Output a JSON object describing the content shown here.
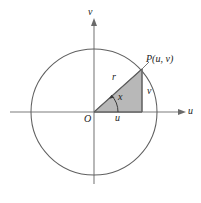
{
  "figure": {
    "type": "geometry-diagram",
    "colors": {
      "stroke": "#555555",
      "axis": "#777777",
      "triangle_fill": "#b4b4b4",
      "triangle_stroke": "#6b6b6b",
      "label": "#1b1b1b",
      "background": "#ffffff"
    },
    "axes": {
      "horizontal_label": "u",
      "vertical_label": "v",
      "origin_label": "O"
    },
    "circle": {
      "center": [
        94,
        112
      ],
      "radius": 63
    },
    "triangle": {
      "vertices": [
        [
          94,
          112
        ],
        [
          142,
          112
        ],
        [
          142,
          69
        ]
      ],
      "hypotenuse_label": "r",
      "angle_label": "x",
      "vertical_leg_label": "v",
      "horizontal_leg_label": "u"
    },
    "point": {
      "label": "P(u, v)",
      "coords": [
        142,
        69
      ]
    }
  }
}
